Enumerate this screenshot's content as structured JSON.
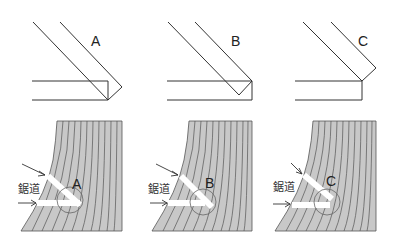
{
  "panels": [
    {
      "id": "A",
      "top_label": "A",
      "bottom_label": "A",
      "kerf_label": "鋸道",
      "description": "Cuts meet exactly at corner"
    },
    {
      "id": "B",
      "top_label": "B",
      "bottom_label": "B",
      "kerf_label": "鋸道",
      "description": "Angled cut falls short of horizontal"
    },
    {
      "id": "C",
      "top_label": "C",
      "bottom_label": "C",
      "kerf_label": "鋸道",
      "description": "Angled cut stops above horizontal"
    }
  ],
  "colors": {
    "line": "#333333",
    "wood_fill": "#c8c8c8",
    "kerf": "#ffffff"
  }
}
